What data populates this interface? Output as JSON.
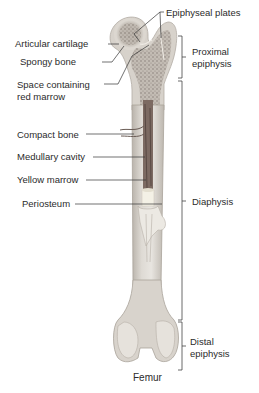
{
  "caption": "Femur",
  "labels_left": [
    {
      "id": "articular-cartilage",
      "text": "Articular cartilage"
    },
    {
      "id": "spongy-bone",
      "text": "Spongy bone"
    },
    {
      "id": "space-red-marrow",
      "line1": "Space containing",
      "line2": "red marrow"
    },
    {
      "id": "compact-bone",
      "text": "Compact bone"
    },
    {
      "id": "medullary-cavity",
      "text": "Medullary cavity"
    },
    {
      "id": "yellow-marrow",
      "text": "Yellow marrow"
    },
    {
      "id": "periosteum",
      "text": "Periosteum"
    }
  ],
  "labels_right": [
    {
      "id": "epiphyseal-plates",
      "text": "Epiphyseal plates"
    },
    {
      "id": "proximal-epiphysis",
      "line1": "Proximal",
      "line2": "epiphysis"
    },
    {
      "id": "diaphysis",
      "text": "Diaphysis"
    },
    {
      "id": "distal-epiphysis",
      "line1": "Distal",
      "line2": "epiphysis"
    }
  ],
  "colors": {
    "bone_light": "#ebe8e3",
    "bone_mid": "#d2cdc6",
    "bone_dark": "#a9a39b",
    "spongy": "#9b9289",
    "marrow_red": "#6e5c55",
    "yellow_marrow": "#f3efe3",
    "leader": "#333333"
  }
}
